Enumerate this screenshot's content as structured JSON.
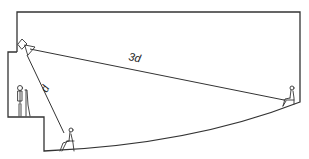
{
  "diagram": {
    "type": "room-section",
    "labels": {
      "near_distance": "d",
      "far_distance": "3d"
    },
    "elements": [
      {
        "id": "loudspeaker",
        "label": "loudspeaker"
      },
      {
        "id": "presenter",
        "label": "standing person at lectern"
      },
      {
        "id": "near_listener",
        "label": "seated listener (near)",
        "distance": "d"
      },
      {
        "id": "far_listener",
        "label": "seated listener (far)",
        "distance": "3d"
      }
    ],
    "colors": {
      "line": "#333333",
      "background": "#ffffff"
    }
  }
}
